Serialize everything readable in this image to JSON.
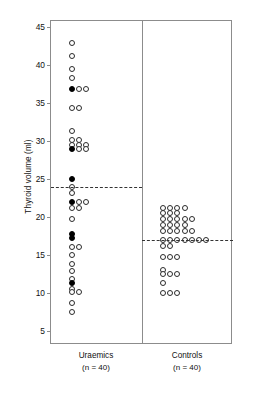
{
  "chart": {
    "type": "dotplot",
    "ylabel": "Thyroid volume (ml)",
    "y_ticks": [
      5,
      10,
      15,
      20,
      25,
      30,
      35,
      40,
      45
    ],
    "ylim": [
      3.2,
      45.8
    ],
    "grid": false,
    "legend": "none",
    "groups": [
      {
        "name": "Uraemics",
        "label": "Uraemics",
        "n_label": "(n = 40)",
        "n": 40,
        "reference_line": 24,
        "marker_open_color": "#ffffff",
        "marker_edge_color": "#2b2b2b",
        "marker_filled_color": "#000000"
      },
      {
        "name": "Controls",
        "label": "Controls",
        "n_label": "(n = 40)",
        "n": 40,
        "reference_line": 17,
        "marker_open_color": "#ffffff",
        "marker_edge_color": "#2b2b2b",
        "marker_filled_color": "#000000"
      }
    ]
  },
  "chart_data": {
    "type": "scatter",
    "title": "",
    "xlabel": "",
    "ylabel": "Thyroid volume (ml)",
    "ylim": [
      3.2,
      45.8
    ],
    "y_ticks": [
      5,
      10,
      15,
      20,
      25,
      30,
      35,
      40,
      45
    ],
    "grid": false,
    "legend": "none",
    "categories": [
      "Uraemics",
      "Controls"
    ],
    "annotations": [
      {
        "text": "Uraemics",
        "sub": "(n = 40)",
        "x": "Uraemics"
      },
      {
        "text": "Controls",
        "sub": "(n = 40)",
        "x": "Controls"
      }
    ],
    "reference_lines": [
      {
        "group": "Uraemics",
        "y": 24,
        "style": "dashed"
      },
      {
        "group": "Controls",
        "y": 17,
        "style": "dashed"
      }
    ],
    "series": [
      {
        "name": "Uraemics",
        "n": 40,
        "marker": "circle",
        "points": [
          {
            "y": 42.9,
            "stack": 0,
            "fill": "open"
          },
          {
            "y": 41.2,
            "stack": 0,
            "fill": "open"
          },
          {
            "y": 39.5,
            "stack": 0,
            "fill": "open"
          },
          {
            "y": 38.3,
            "stack": 0,
            "fill": "open"
          },
          {
            "y": 36.8,
            "stack": 0,
            "fill": "filled"
          },
          {
            "y": 36.8,
            "stack": 1,
            "fill": "open"
          },
          {
            "y": 36.8,
            "stack": 2,
            "fill": "open"
          },
          {
            "y": 34.4,
            "stack": 0,
            "fill": "open"
          },
          {
            "y": 34.4,
            "stack": 1,
            "fill": "open"
          },
          {
            "y": 31.4,
            "stack": 0,
            "fill": "open"
          },
          {
            "y": 30.1,
            "stack": 0,
            "fill": "open"
          },
          {
            "y": 30.1,
            "stack": 1,
            "fill": "open"
          },
          {
            "y": 29.5,
            "stack": 0,
            "fill": "open"
          },
          {
            "y": 29.5,
            "stack": 1,
            "fill": "open"
          },
          {
            "y": 29.5,
            "stack": 2,
            "fill": "open"
          },
          {
            "y": 29.0,
            "stack": 0,
            "fill": "filled"
          },
          {
            "y": 29.0,
            "stack": 1,
            "fill": "open"
          },
          {
            "y": 29.0,
            "stack": 2,
            "fill": "open"
          },
          {
            "y": 25.0,
            "stack": 0,
            "fill": "filled"
          },
          {
            "y": 24.0,
            "stack": 0,
            "fill": "open"
          },
          {
            "y": 23.2,
            "stack": 0,
            "fill": "open"
          },
          {
            "y": 22.0,
            "stack": 0,
            "fill": "filled"
          },
          {
            "y": 22.0,
            "stack": 1,
            "fill": "open"
          },
          {
            "y": 22.0,
            "stack": 2,
            "fill": "open"
          },
          {
            "y": 21.2,
            "stack": 0,
            "fill": "open"
          },
          {
            "y": 21.2,
            "stack": 1,
            "fill": "open"
          },
          {
            "y": 19.8,
            "stack": 0,
            "fill": "open"
          },
          {
            "y": 17.8,
            "stack": 0,
            "fill": "filled"
          },
          {
            "y": 17.3,
            "stack": 0,
            "fill": "filled"
          },
          {
            "y": 16.1,
            "stack": 0,
            "fill": "open"
          },
          {
            "y": 16.1,
            "stack": 1,
            "fill": "open"
          },
          {
            "y": 15.0,
            "stack": 0,
            "fill": "open"
          },
          {
            "y": 13.9,
            "stack": 0,
            "fill": "open"
          },
          {
            "y": 12.9,
            "stack": 0,
            "fill": "open"
          },
          {
            "y": 11.9,
            "stack": 0,
            "fill": "open"
          },
          {
            "y": 11.3,
            "stack": 0,
            "fill": "filled"
          },
          {
            "y": 10.6,
            "stack": 0,
            "fill": "open"
          },
          {
            "y": 10.2,
            "stack": 0,
            "fill": "open"
          },
          {
            "y": 10.2,
            "stack": 1,
            "fill": "open"
          },
          {
            "y": 8.7,
            "stack": 0,
            "fill": "open"
          },
          {
            "y": 7.6,
            "stack": 0,
            "fill": "open"
          }
        ]
      },
      {
        "name": "Controls",
        "n": 40,
        "marker": "circle",
        "points": [
          {
            "y": 21.2,
            "stack": 0,
            "fill": "open"
          },
          {
            "y": 21.2,
            "stack": 1,
            "fill": "open"
          },
          {
            "y": 21.2,
            "stack": 2,
            "fill": "open"
          },
          {
            "y": 21.2,
            "stack": 3,
            "fill": "open"
          },
          {
            "y": 20.5,
            "stack": 0,
            "fill": "open"
          },
          {
            "y": 20.5,
            "stack": 1,
            "fill": "open"
          },
          {
            "y": 20.5,
            "stack": 2,
            "fill": "open"
          },
          {
            "y": 19.8,
            "stack": 0,
            "fill": "open"
          },
          {
            "y": 19.8,
            "stack": 1,
            "fill": "open"
          },
          {
            "y": 19.8,
            "stack": 2,
            "fill": "open"
          },
          {
            "y": 19.8,
            "stack": 3,
            "fill": "open"
          },
          {
            "y": 19.8,
            "stack": 4,
            "fill": "open"
          },
          {
            "y": 19.0,
            "stack": 0,
            "fill": "open"
          },
          {
            "y": 19.0,
            "stack": 1,
            "fill": "open"
          },
          {
            "y": 19.0,
            "stack": 2,
            "fill": "open"
          },
          {
            "y": 19.0,
            "stack": 3,
            "fill": "open"
          },
          {
            "y": 18.2,
            "stack": 0,
            "fill": "open"
          },
          {
            "y": 18.2,
            "stack": 1,
            "fill": "open"
          },
          {
            "y": 18.2,
            "stack": 2,
            "fill": "open"
          },
          {
            "y": 18.2,
            "stack": 3,
            "fill": "open"
          },
          {
            "y": 18.2,
            "stack": 4,
            "fill": "open"
          },
          {
            "y": 17.0,
            "stack": 0,
            "fill": "open"
          },
          {
            "y": 17.0,
            "stack": 1,
            "fill": "open"
          },
          {
            "y": 17.0,
            "stack": 2,
            "fill": "open"
          },
          {
            "y": 17.0,
            "stack": 3,
            "fill": "open"
          },
          {
            "y": 17.0,
            "stack": 4,
            "fill": "open"
          },
          {
            "y": 17.0,
            "stack": 5,
            "fill": "open"
          },
          {
            "y": 17.0,
            "stack": 6,
            "fill": "open"
          },
          {
            "y": 16.2,
            "stack": 0,
            "fill": "open"
          },
          {
            "y": 16.2,
            "stack": 1,
            "fill": "open"
          },
          {
            "y": 14.8,
            "stack": 0,
            "fill": "open"
          },
          {
            "y": 14.8,
            "stack": 1,
            "fill": "open"
          },
          {
            "y": 14.8,
            "stack": 2,
            "fill": "open"
          },
          {
            "y": 13.0,
            "stack": 0,
            "fill": "open"
          },
          {
            "y": 12.5,
            "stack": 0,
            "fill": "open"
          },
          {
            "y": 12.5,
            "stack": 1,
            "fill": "open"
          },
          {
            "y": 12.5,
            "stack": 2,
            "fill": "open"
          },
          {
            "y": 11.4,
            "stack": 0,
            "fill": "open"
          },
          {
            "y": 10.0,
            "stack": 0,
            "fill": "open"
          },
          {
            "y": 10.0,
            "stack": 1,
            "fill": "open"
          },
          {
            "y": 10.0,
            "stack": 2,
            "fill": "open"
          }
        ]
      }
    ]
  }
}
